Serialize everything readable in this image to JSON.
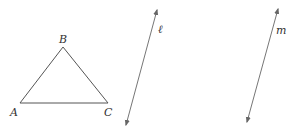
{
  "diagram": {
    "triangle": {
      "vertices": [
        {
          "name": "A",
          "x": 20,
          "y": 103
        },
        {
          "name": "B",
          "x": 63,
          "y": 47
        },
        {
          "name": "C",
          "x": 108,
          "y": 103
        }
      ],
      "labels": {
        "A": "A",
        "B": "B",
        "C": "C"
      }
    },
    "lines": [
      {
        "name": "ℓ",
        "label": "ℓ",
        "x1": 157,
        "y1": 10,
        "x2": 126,
        "y2": 125
      },
      {
        "name": "m",
        "label": "m",
        "x1": 278,
        "y1": 9,
        "x2": 247,
        "y2": 122
      }
    ],
    "colors": {
      "stroke": "#555555",
      "arrow": "#666666"
    }
  }
}
